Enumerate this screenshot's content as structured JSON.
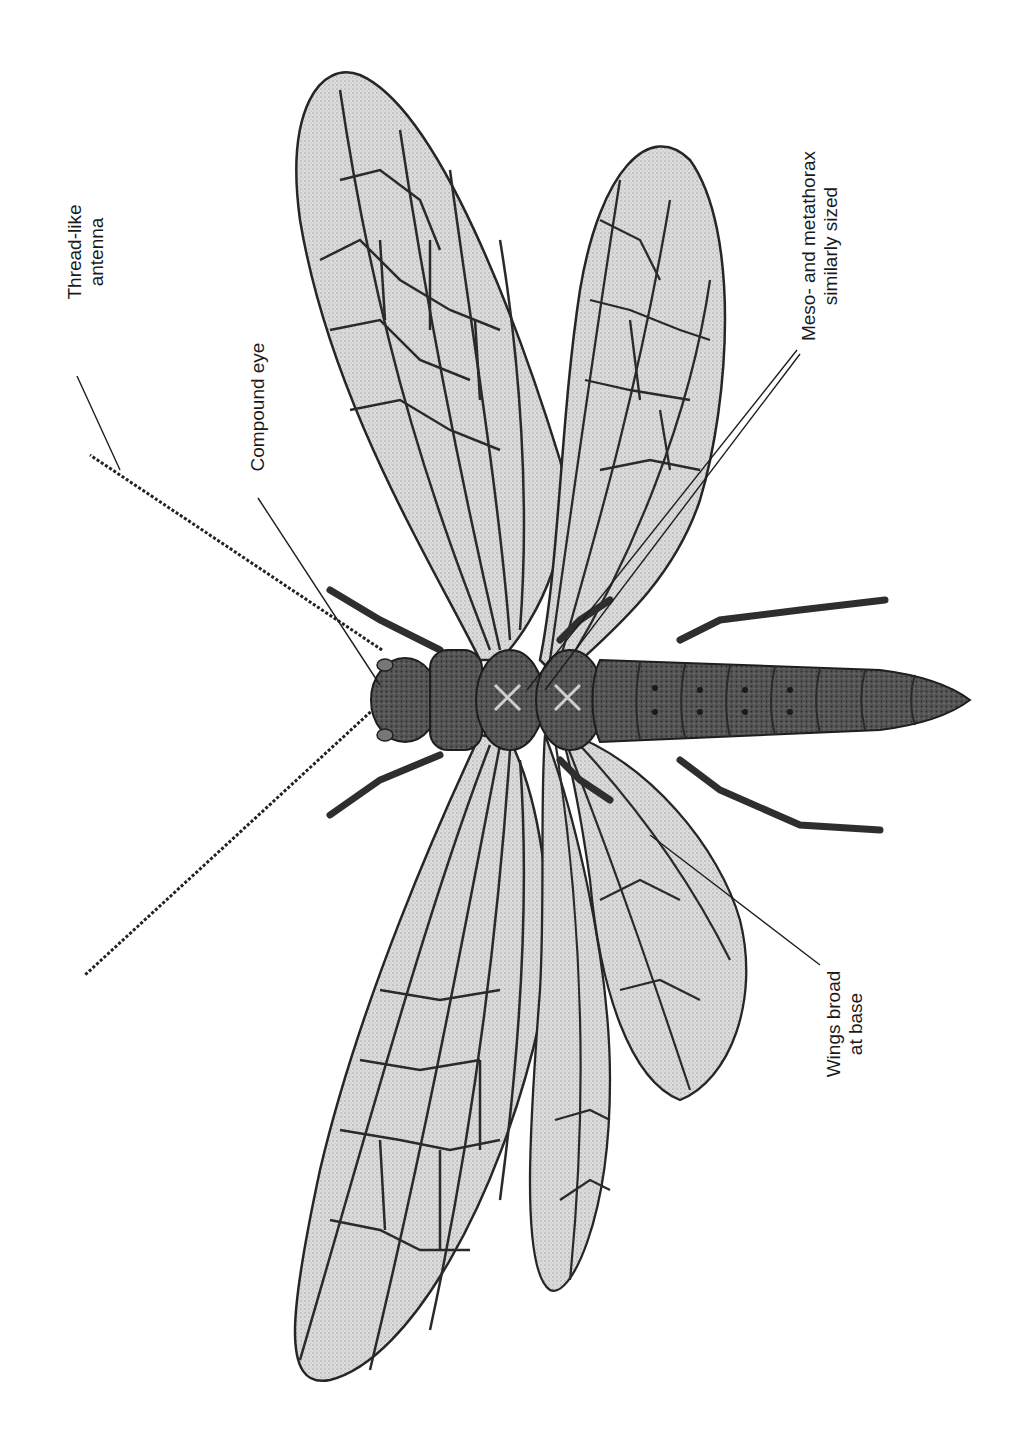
{
  "figure": {
    "background": "#ffffff",
    "ink_color": "#1f1f1f",
    "wing_fill": "#d8d8d8",
    "body_fill": "#4a4a4a"
  },
  "labels": [
    {
      "id": "antenna",
      "lines": [
        "Thread-like",
        "antenna"
      ],
      "text_center": [
        86,
        252
      ],
      "leader": [
        [
          77,
          376
        ],
        [
          120,
          470
        ]
      ]
    },
    {
      "id": "compound-eye",
      "lines": [
        "Compound eye"
      ],
      "text_center": [
        258,
        407
      ],
      "leader": [
        [
          258,
          498
        ],
        [
          380,
          685
        ]
      ]
    },
    {
      "id": "meso-metathorax",
      "lines": [
        "Meso- and metathorax",
        "similarly sized"
      ],
      "text_center": [
        820,
        246
      ],
      "leader": [
        [
          797,
          350
        ],
        [
          527,
          690
        ]
      ],
      "leader2": [
        [
          800,
          354
        ],
        [
          545,
          690
        ]
      ]
    },
    {
      "id": "wings-base",
      "lines": [
        "Wings broad",
        "at base"
      ],
      "text_center": [
        845,
        1024
      ],
      "leader": [
        [
          820,
          965
        ],
        [
          650,
          835
        ]
      ]
    }
  ]
}
